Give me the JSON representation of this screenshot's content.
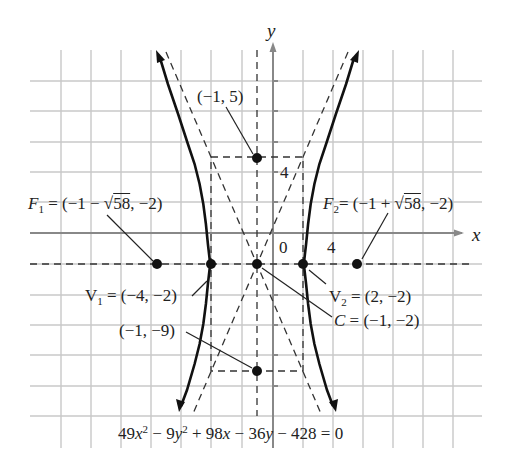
{
  "diagram": {
    "type": "hyperbola-graph",
    "equation": "49x² − 9y² + 98x − 36y − 428 = 0",
    "equation_parts": {
      "a": "49",
      "x": "x",
      "b": " − 9",
      "y": "y",
      "c": " + 98",
      "x2": "x",
      "d": " − 36",
      "y2": "y",
      "e": " − 428 = 0"
    },
    "axes": {
      "x_label": "x",
      "y_label": "y",
      "origin_label": "0",
      "x_tick_label": "4",
      "y_tick_label": "4"
    },
    "points": {
      "focus1": {
        "name": "F",
        "sub": "1",
        "text": " = (−1 − ",
        "root": "58",
        "tail": ", −2)"
      },
      "focus2": {
        "name": "F",
        "sub": "2",
        "text": "= (−1 + ",
        "root": "58",
        "tail": ", −2)"
      },
      "vertex1": {
        "name": "V",
        "sub": "1",
        "text": " = (−4, −2)"
      },
      "vertex2": {
        "name": "V",
        "sub": "2",
        "text": " = (2, −2)"
      },
      "center": {
        "name": "C",
        "text": " = (−1, −2)"
      },
      "top": {
        "text": "(−1, 5)"
      },
      "bottom": {
        "text": "(−1, −9)"
      }
    },
    "colors": {
      "grid": "#c8c8c8",
      "axis": "#888888",
      "curve": "#111111",
      "dashed": "#333333"
    }
  }
}
